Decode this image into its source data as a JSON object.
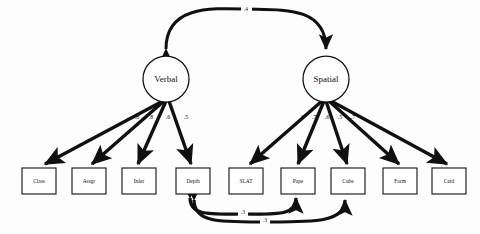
{
  "diagram": {
    "type": "sem-path-diagram",
    "stroke_color": "#101010",
    "fill_color": "#ffffff",
    "background_color": "#fdfdfd",
    "latent_factors": [
      {
        "id": "verbal",
        "label": "Verbal",
        "cx": 166,
        "cy": 79,
        "r": 23
      },
      {
        "id": "spatial",
        "label": "Spatial",
        "cx": 326,
        "cy": 79,
        "r": 23
      }
    ],
    "observed_variables": [
      {
        "id": "class",
        "label": "Class",
        "x": 22,
        "y": 168,
        "w": 34,
        "h": 26
      },
      {
        "id": "assgr",
        "label": "Assgr",
        "x": 72,
        "y": 168,
        "w": 34,
        "h": 26
      },
      {
        "id": "infer",
        "label": "Infer",
        "x": 122,
        "y": 168,
        "w": 34,
        "h": 26
      },
      {
        "id": "depth",
        "label": "Depth",
        "x": 176,
        "y": 168,
        "w": 34,
        "h": 26
      },
      {
        "id": "slat",
        "label": "SLAT",
        "x": 229,
        "y": 168,
        "w": 34,
        "h": 26
      },
      {
        "id": "paper",
        "label": "Pape",
        "x": 281,
        "y": 168,
        "w": 34,
        "h": 26
      },
      {
        "id": "cube",
        "label": "Cube",
        "x": 331,
        "y": 168,
        "w": 34,
        "h": 26
      },
      {
        "id": "form",
        "label": "Form",
        "x": 383,
        "y": 168,
        "w": 34,
        "h": 26
      },
      {
        "id": "card",
        "label": "Card",
        "x": 432,
        "y": 168,
        "w": 34,
        "h": 26
      }
    ],
    "factor_loadings": [
      {
        "from": "verbal",
        "to": "class",
        "coefficient": ".8",
        "label_x": 137,
        "label_y": 118
      },
      {
        "from": "verbal",
        "to": "assgr",
        "coefficient": ".8",
        "label_x": 151,
        "label_y": 118
      },
      {
        "from": "verbal",
        "to": "infer",
        "coefficient": ".6",
        "label_x": 168,
        "label_y": 118
      },
      {
        "from": "verbal",
        "to": "depth",
        "coefficient": ".5",
        "label_x": 186,
        "label_y": 118
      },
      {
        "from": "spatial",
        "to": "slat",
        "coefficient": ".8",
        "label_x": 302,
        "label_y": 118
      },
      {
        "from": "spatial",
        "to": "paper",
        "coefficient": ".7",
        "label_x": 314,
        "label_y": 118
      },
      {
        "from": "spatial",
        "to": "cube",
        "coefficient": ".6",
        "label_x": 327,
        "label_y": 118
      },
      {
        "from": "spatial",
        "to": "form",
        "coefficient": ".5",
        "label_x": 340,
        "label_y": 118
      },
      {
        "from": "spatial",
        "to": "card",
        "coefficient": ".7",
        "label_x": 353,
        "label_y": 118
      }
    ],
    "factor_correlation": {
      "from": "verbal",
      "to": "spatial",
      "coefficient": ".4",
      "label_x": 246,
      "label_y": 12
    },
    "residual_correlations": [
      {
        "from": "depth",
        "to": "paper",
        "coefficient": ".3",
        "label_x": 243,
        "label_y": 213
      },
      {
        "from": "depth",
        "to": "cube",
        "coefficient": ".3",
        "label_x": 265,
        "label_y": 221
      }
    ]
  }
}
